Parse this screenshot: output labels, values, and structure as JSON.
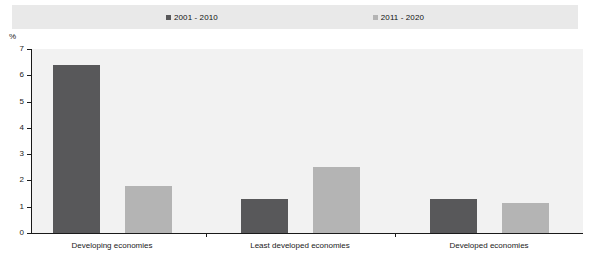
{
  "legend": {
    "entries": [
      {
        "label": "2001 - 2010",
        "color": "#58585a",
        "marker": "square-marker-icon"
      },
      {
        "label": "2011 - 2020",
        "color": "#b4b4b4",
        "marker": "square-marker-icon"
      }
    ]
  },
  "axis": {
    "unit_label": "%",
    "y_ticks": [
      "0",
      "1",
      "2",
      "3",
      "4",
      "5",
      "6",
      "7"
    ]
  },
  "colors": {
    "series_1": "#58585a",
    "series_2": "#b4b4b4",
    "legend_band": "#e9e9e9",
    "plot_background": "#f2f2f2",
    "axis": "#1a1a1a"
  },
  "chart_data": {
    "type": "bar",
    "title": "",
    "xlabel": "",
    "ylabel": "%",
    "ylim": [
      0,
      7
    ],
    "yticks": [
      0,
      1,
      2,
      3,
      4,
      5,
      6,
      7
    ],
    "grid": false,
    "legend_position": "top",
    "categories": [
      "Developing economies",
      "Least developed economies",
      "Developed economies"
    ],
    "series": [
      {
        "name": "2001 - 2010",
        "color": "#58585a",
        "values": [
          6.4,
          1.3,
          1.3
        ]
      },
      {
        "name": "2011 - 2020",
        "color": "#b4b4b4",
        "values": [
          1.8,
          2.5,
          1.15
        ]
      }
    ]
  }
}
